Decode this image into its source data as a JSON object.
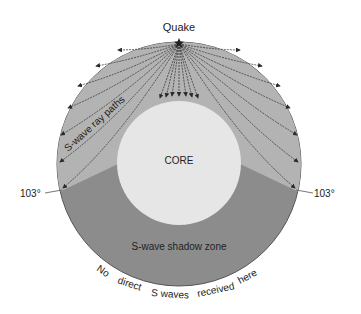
{
  "labels": {
    "quake": "Quake",
    "core": "CORE",
    "ray_paths": "S-wave ray paths",
    "shadow_zone": "S-wave shadow zone",
    "left_angle": "103°",
    "right_angle": "103°",
    "arc_text": [
      "No",
      "direct",
      "S waves",
      "received",
      "here"
    ]
  },
  "colors": {
    "background": "#ffffff",
    "mantle_ray_zone": "#b3b3b3",
    "shadow_zone": "#8c8c8c",
    "core": "#e6e6e6",
    "ray_line": "#3a3a3a",
    "outline": "#555555"
  },
  "geometry": {
    "center": [
      179,
      164
    ],
    "outer_radius": 122,
    "core_radius": 62,
    "shadow_angle_deg": 103
  }
}
